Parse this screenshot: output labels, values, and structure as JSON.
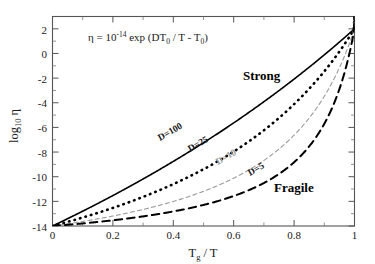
{
  "chart_data": {
    "type": "line",
    "title": "",
    "xlabel": "T_g / T",
    "ylabel": "log10 eta",
    "xlim": [
      0,
      1
    ],
    "ylim": [
      -14,
      3
    ],
    "grid": false,
    "legend_position": "inline-curve-labels",
    "annotation_equation": "eta = 10^-14 exp (D T0 / T - T0)",
    "xticks": [
      "0",
      "0.2",
      "0.4",
      "0.6",
      "0.8",
      "1"
    ],
    "xtick_values": [
      0,
      0.2,
      0.4,
      0.6,
      0.8,
      1
    ],
    "yticks": [
      "2",
      "0",
      "-2",
      "-4",
      "-6",
      "-8",
      "-10",
      "-12",
      "-14"
    ],
    "ytick_values": [
      2,
      0,
      -2,
      -4,
      -6,
      -8,
      -10,
      -12,
      -14
    ],
    "annotations": [
      {
        "text": "Strong",
        "x": 0.7,
        "y": -2.0
      },
      {
        "text": "Fragile",
        "x": 0.8,
        "y": -11.3
      }
    ],
    "series": [
      {
        "name": "D=100",
        "label": "D=100",
        "style": "solid",
        "color": "#000000",
        "x": [
          0,
          0.05,
          0.1,
          0.15,
          0.2,
          0.25,
          0.3,
          0.35,
          0.4,
          0.45,
          0.5,
          0.55,
          0.6,
          0.65,
          0.7,
          0.75,
          0.8,
          0.85,
          0.9,
          0.95,
          1.0
        ],
        "y": [
          -14.0,
          -13.22,
          -12.44,
          -11.64,
          -10.84,
          -10.02,
          -9.18,
          -8.33,
          -7.46,
          -6.57,
          -5.66,
          -4.72,
          -3.76,
          -2.77,
          -1.75,
          -0.7,
          0.39,
          1.51,
          2.67,
          3.87,
          5.11
        ]
      },
      {
        "name": "D=25",
        "label": "D=25",
        "style": "dotted",
        "color": "#000000",
        "x": [
          0,
          0.05,
          0.1,
          0.15,
          0.2,
          0.25,
          0.3,
          0.35,
          0.4,
          0.45,
          0.5,
          0.55,
          0.6,
          0.65,
          0.7,
          0.75,
          0.8,
          0.85,
          0.9,
          0.95,
          1.0
        ],
        "y": [
          -14.0,
          -13.6,
          -13.18,
          -12.74,
          -12.28,
          -11.79,
          -11.28,
          -10.73,
          -10.15,
          -9.54,
          -8.88,
          -8.17,
          -7.42,
          -6.6,
          -5.71,
          -4.75,
          -3.69,
          -2.52,
          -1.22,
          0.25,
          1.9
        ]
      },
      {
        "name": "D=10",
        "label": "D=10",
        "style": "dashed-fine",
        "color": "#9a9a9a",
        "x": [
          0,
          0.05,
          0.1,
          0.15,
          0.2,
          0.25,
          0.3,
          0.35,
          0.4,
          0.45,
          0.5,
          0.55,
          0.6,
          0.65,
          0.7,
          0.75,
          0.8,
          0.85,
          0.9,
          0.95,
          1.0
        ],
        "y": [
          -14.0,
          -13.8,
          -13.58,
          -13.35,
          -13.1,
          -12.83,
          -12.54,
          -12.22,
          -11.87,
          -11.48,
          -11.06,
          -10.58,
          -10.05,
          -9.44,
          -8.74,
          -7.93,
          -6.96,
          -5.79,
          -4.33,
          -2.45,
          0.05
        ]
      },
      {
        "name": "D=5",
        "label": "D=5",
        "style": "dashed-bold",
        "color": "#000000",
        "x": [
          0,
          0.05,
          0.1,
          0.15,
          0.2,
          0.25,
          0.3,
          0.35,
          0.4,
          0.45,
          0.5,
          0.55,
          0.6,
          0.65,
          0.7,
          0.75,
          0.8,
          0.85,
          0.9,
          0.95,
          1.0
        ],
        "y": [
          -14.0,
          -13.89,
          -13.77,
          -13.64,
          -13.5,
          -13.34,
          -13.17,
          -12.98,
          -12.77,
          -12.53,
          -12.26,
          -11.96,
          -11.61,
          -11.2,
          -10.72,
          -10.13,
          -9.4,
          -8.46,
          -7.18,
          -5.31,
          -2.33
        ]
      }
    ]
  },
  "labels": {
    "equation_eta": "η",
    "equation_eq": "=",
    "equation_base": "10",
    "equation_exp": "-14",
    "equation_exp_fn": "exp (DT",
    "equation_sub0a": "0",
    "equation_mid": "/ T - T",
    "equation_sub0b": "0",
    "equation_close": ")",
    "ylabel_main": "log",
    "ylabel_sub": "10",
    "ylabel_eta": "η",
    "xlabel_t": "T",
    "xlabel_sub": "g",
    "xlabel_rest": "/ T",
    "strong": "Strong",
    "fragile": "Fragile",
    "d100": "D=100",
    "d25": "D=25",
    "d10": "D=10",
    "d5": "D=5",
    "xt0": "0",
    "xt1": "0.2",
    "xt2": "0.4",
    "xt3": "0.6",
    "xt4": "0.8",
    "xt5": "1",
    "yt0": "2",
    "yt1": "0",
    "yt2": "-2",
    "yt3": "-4",
    "yt4": "-6",
    "yt5": "-8",
    "yt6": "-10",
    "yt7": "-12",
    "yt8": "-14"
  }
}
